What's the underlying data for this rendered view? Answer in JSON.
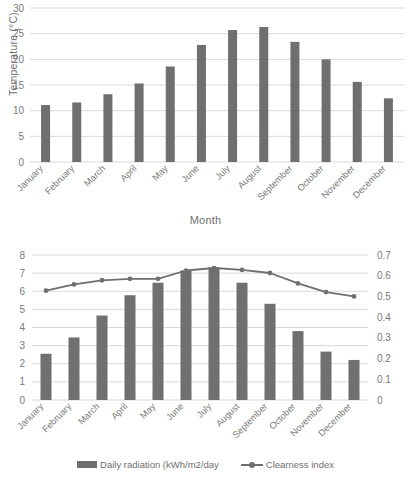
{
  "chart_data": [
    {
      "type": "bar",
      "title": "",
      "xlabel": "Month",
      "ylabel": "Temperature (°C)",
      "categories": [
        "January",
        "February",
        "March",
        "April",
        "May",
        "June",
        "July",
        "August",
        "September",
        "October",
        "November",
        "December"
      ],
      "values": [
        11.1,
        11.6,
        13.2,
        15.3,
        18.6,
        22.8,
        25.7,
        26.3,
        23.4,
        20.0,
        15.6,
        12.4
      ],
      "ylim": [
        0,
        30
      ],
      "yticks": [
        0,
        5,
        10,
        15,
        20,
        25,
        30
      ],
      "ytick_labels": [
        "0",
        "5",
        "10",
        "15",
        "20",
        "25",
        "30"
      ],
      "grid": true,
      "legend": "none",
      "series_color": "#6f6f6f"
    },
    {
      "type": "bar",
      "title": "",
      "xlabel": "",
      "ylabel": "",
      "categories": [
        "January",
        "February",
        "March",
        "April",
        "May",
        "June",
        "July",
        "August",
        "September",
        "October",
        "November",
        "December"
      ],
      "series": [
        {
          "name": "Daily radiation (kWh/m2/day",
          "kind": "bar",
          "axis": "left",
          "values": [
            2.55,
            3.45,
            4.66,
            5.78,
            6.47,
            7.15,
            7.32,
            6.47,
            5.31,
            3.8,
            2.67,
            2.21
          ]
        },
        {
          "name": "Clearness index",
          "kind": "line",
          "axis": "right",
          "values": [
            0.528,
            0.558,
            0.578,
            0.585,
            0.585,
            0.625,
            0.637,
            0.628,
            0.613,
            0.563,
            0.521,
            0.5
          ]
        }
      ],
      "ylim": [
        0,
        8
      ],
      "yticks": [
        0,
        1,
        2,
        3,
        4,
        5,
        6,
        7,
        8
      ],
      "ytick_labels": [
        "0",
        "1",
        "2",
        "3",
        "4",
        "5",
        "6",
        "7",
        "8"
      ],
      "y2lim": [
        0,
        0.7
      ],
      "y2ticks": [
        0,
        0.1,
        0.2,
        0.3,
        0.4,
        0.5,
        0.6,
        0.7
      ],
      "y2tick_labels": [
        "0",
        "0.1",
        "0.2",
        "0.3",
        "0.4",
        "0.5",
        "0.6",
        "0.7"
      ],
      "grid": true,
      "legend": "bottom",
      "series_color": "#6f6f6f"
    }
  ],
  "legend": {
    "bar_label": "Daily radiation (kWh/m2/day",
    "line_label": "Clearness index"
  },
  "axes": {
    "temp_y_title": "Temperature (°C)",
    "temp_x_title": "Month"
  },
  "colors": {
    "series": "#6f6f6f",
    "grid": "#d9d9d9",
    "text": "#7a7a7a",
    "background": "#ffffff"
  }
}
